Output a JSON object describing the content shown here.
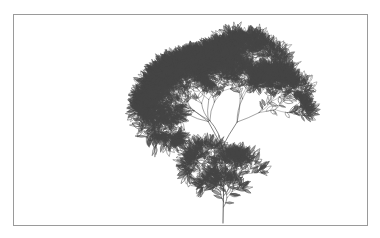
{
  "page": {
    "background_color": "#ffffff",
    "width": 380,
    "height": 238
  },
  "margin_text": {
    "fragments": [
      "n",
      "n",
      "-"
    ],
    "color": "#4a4a4a"
  },
  "figure": {
    "frame": {
      "x": 13,
      "y": 14,
      "width": 355,
      "height": 212,
      "border_color": "#9a9a9a",
      "border_width": 1,
      "fill": "#ffffff"
    },
    "caption": "",
    "illustration_name": "fractal-plant-bush"
  },
  "chart_data": {
    "type": "scatter",
    "title": "",
    "subtitle": "",
    "xlabel": "",
    "ylabel": "",
    "grid": false,
    "legend": null,
    "ink_color": "#3c3c3c",
    "leaf_color": "#454545",
    "plant": {
      "stem_base_x": 209,
      "stem_base_y": 208,
      "stem_top_y": 170,
      "canopy_top_y": 8,
      "canopy_left_x": 119,
      "canopy_right_x": 252,
      "trunk_length": 38,
      "trunk_angle_deg": -90,
      "recursion_depth": 8,
      "branch_decay": 0.78,
      "branch_angles_deg": [
        -26,
        24,
        -11,
        13
      ],
      "leaf_length": 9.5,
      "leaf_width": 2.9,
      "random_seed": 20240817,
      "stroke_width_base": 0.85,
      "stroke_width_min": 0.3,
      "jitter": 0.42
    }
  }
}
